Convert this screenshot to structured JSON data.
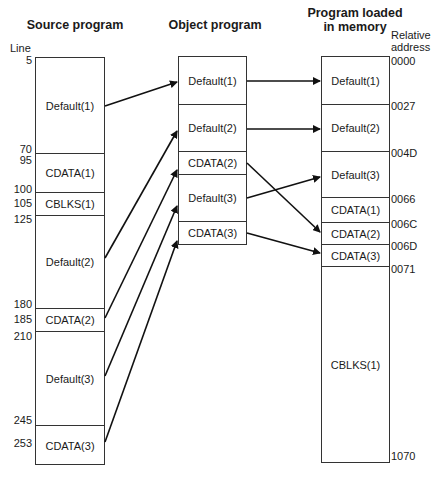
{
  "headers": {
    "source": "Source program",
    "object": "Object program",
    "memory_line1": "Program loaded",
    "memory_line2": "in memory"
  },
  "axis_labels": {
    "line": "Line",
    "relative_line1": "Relative",
    "relative_line2": "address"
  },
  "source_program": {
    "segments": [
      {
        "label": "Default(1)"
      },
      {
        "label": "CDATA(1)"
      },
      {
        "label": "CBLKS(1)"
      },
      {
        "label": "Default(2)"
      },
      {
        "label": "CDATA(2)"
      },
      {
        "label": "Default(3)"
      },
      {
        "label": "CDATA(3)"
      }
    ],
    "line_numbers": [
      "5",
      "70",
      "95",
      "100",
      "105",
      "125",
      "180",
      "185",
      "210",
      "245",
      "253"
    ]
  },
  "object_program": {
    "segments": [
      {
        "label": "Default(1)"
      },
      {
        "label": "Default(2)"
      },
      {
        "label": "CDATA(2)"
      },
      {
        "label": "Default(3)"
      },
      {
        "label": "CDATA(3)"
      }
    ]
  },
  "memory": {
    "segments": [
      {
        "label": "Default(1)"
      },
      {
        "label": "Default(2)"
      },
      {
        "label": "Default(3)"
      },
      {
        "label": "CDATA(1)"
      },
      {
        "label": "CDATA(2)"
      },
      {
        "label": "CDATA(3)"
      },
      {
        "label": "CBLKS(1)"
      }
    ],
    "addresses": [
      "0000",
      "0027",
      "004D",
      "0066",
      "006C",
      "006D",
      "0071",
      "1070"
    ]
  },
  "arrows": [
    {
      "from": "source Default(1)",
      "to": "object Default(1)"
    },
    {
      "from": "source Default(2)",
      "to": "object Default(2)"
    },
    {
      "from": "source CDATA(2)",
      "to": "object CDATA(2)"
    },
    {
      "from": "source Default(3)",
      "to": "object Default(3)"
    },
    {
      "from": "source CDATA(3)",
      "to": "object CDATA(3)"
    },
    {
      "from": "object Default(1)",
      "to": "memory Default(1)"
    },
    {
      "from": "object Default(2)",
      "to": "memory Default(2)"
    },
    {
      "from": "object CDATA(2)",
      "to": "memory CDATA(2)"
    },
    {
      "from": "object Default(3)",
      "to": "memory Default(3)"
    },
    {
      "from": "object CDATA(3)",
      "to": "memory CDATA(3)"
    }
  ]
}
